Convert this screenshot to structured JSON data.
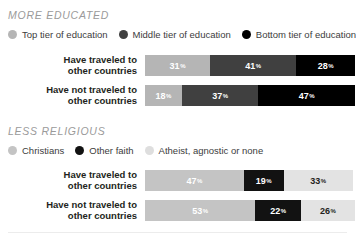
{
  "chart_data": {
    "type": "bar",
    "title": "",
    "subtype": "stacked-horizontal-100",
    "xlabel": "",
    "ylabel": "",
    "xlim": [
      0,
      100
    ],
    "grid": false,
    "legend_position": "top",
    "panels": [
      {
        "id": "more-educated",
        "title": "MORE EDUCATED",
        "legend": [
          {
            "label": "Top tier of education",
            "color": "#b5b5b5"
          },
          {
            "label": "Middle tier of education",
            "color": "#404040"
          },
          {
            "label": "Bottom tier of education",
            "color": "#000000"
          }
        ],
        "categories": [
          "Have traveled to other countries",
          "Have not traveled to other countries"
        ],
        "category_lines": [
          [
            "Have traveled to",
            "other countries"
          ],
          [
            "Have not traveled to",
            "other countries"
          ]
        ],
        "series": [
          {
            "name": "Top tier of education",
            "color": "#b5b5b5",
            "text_color": "#ffffff",
            "values": [
              31,
              18
            ]
          },
          {
            "name": "Middle tier of education",
            "color": "#404040",
            "text_color": "#ffffff",
            "values": [
              41,
              37
            ]
          },
          {
            "name": "Bottom tier of education",
            "color": "#000000",
            "text_color": "#ffffff",
            "values": [
              28,
              47
            ]
          }
        ]
      },
      {
        "id": "less-religious",
        "title": "LESS RELIGIOUS",
        "legend": [
          {
            "label": "Christians",
            "color": "#c4c4c4"
          },
          {
            "label": "Other faith",
            "color": "#121212"
          },
          {
            "label": "Atheist, agnostic or none",
            "color": "#dedede"
          }
        ],
        "categories": [
          "Have traveled to other countries",
          "Have not traveled to other countries"
        ],
        "category_lines": [
          [
            "Have traveled to",
            "other countries"
          ],
          [
            "Have not traveled to",
            "other countries"
          ]
        ],
        "series": [
          {
            "name": "Christians",
            "color": "#c4c4c4",
            "text_color": "#ffffff",
            "values": [
              47,
              53
            ]
          },
          {
            "name": "Other faith",
            "color": "#121212",
            "text_color": "#ffffff",
            "values": [
              19,
              22
            ]
          },
          {
            "name": "Atheist, agnostic or none",
            "color": "#e3e3e3",
            "text_color": "#231f20",
            "values": [
              33,
              26
            ]
          }
        ]
      }
    ]
  },
  "percent_symbol": "%"
}
